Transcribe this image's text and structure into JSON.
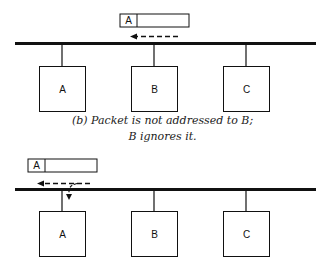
{
  "panel_b": {
    "packet": {
      "address_label": "A"
    },
    "nodes": [
      {
        "label": "A"
      },
      {
        "label": "B"
      },
      {
        "label": "C"
      }
    ],
    "caption_line1": "(b)  Packet is not addressed to B;",
    "caption_line2": "B ignores it."
  },
  "panel_c": {
    "packet": {
      "address_label": "A"
    },
    "nodes": [
      {
        "label": "A"
      },
      {
        "label": "B"
      },
      {
        "label": "C"
      }
    ]
  }
}
